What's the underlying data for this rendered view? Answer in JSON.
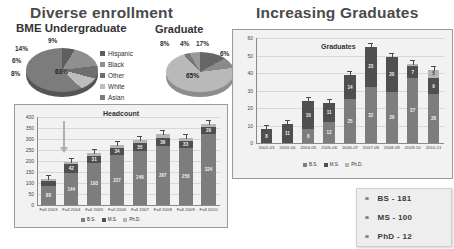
{
  "slide": {
    "titles": {
      "left": "Diverse enrollment",
      "right": "Increasing Graduates",
      "pie_undergrad": "BME Undergraduate",
      "pie_grad": "Graduate"
    }
  },
  "pie_legend": [
    {
      "label": "Hispanic",
      "color": "#5e5e5e"
    },
    {
      "label": "Black",
      "color": "#8f8f8f"
    },
    {
      "label": "Other",
      "color": "#6e6e6e"
    },
    {
      "label": "White",
      "color": "#bdbdbd"
    },
    {
      "label": "Asian",
      "color": "#7c7c7c"
    }
  ],
  "bar_legend": [
    {
      "label": "B.S.",
      "color": "#7d7d7d"
    },
    {
      "label": "M.S.",
      "color": "#4f4f4f"
    },
    {
      "label": "Ph.D.",
      "color": "#b5b5b5"
    }
  ],
  "summary": {
    "items": [
      {
        "label": "BS - 181"
      },
      {
        "label": "MS - 100"
      },
      {
        "label": "PhD - 12"
      }
    ]
  },
  "chart_data": [
    {
      "type": "pie",
      "title": "BME Undergraduate",
      "categories": [
        "Hispanic",
        "Black",
        "Other",
        "White",
        "Asian"
      ],
      "values": [
        9,
        14,
        6,
        8,
        63
      ],
      "labels": [
        "9%",
        "14%",
        "6%",
        "8%",
        "63%"
      ],
      "legend_position": "right"
    },
    {
      "type": "pie",
      "title": "Graduate",
      "categories": [
        "Hispanic",
        "Black",
        "Other",
        "White",
        "Asian"
      ],
      "values": [
        17,
        6,
        65,
        4,
        8
      ],
      "labels": [
        "17%",
        "6%",
        "65%",
        "4%",
        "8%"
      ],
      "legend_position": "shared-left"
    },
    {
      "type": "bar",
      "subtype": "stacked",
      "title": "Headcount",
      "xlabel": "",
      "ylabel": "",
      "ylim": [
        0,
        400
      ],
      "yticks": [
        0,
        50,
        100,
        150,
        200,
        250,
        300,
        350,
        400
      ],
      "grid": true,
      "categories": [
        "Fall 2003",
        "Fall 2004",
        "Fall 2005",
        "Fall 2006",
        "Fall 2007",
        "Fall 2008",
        "Fall 2009",
        "Fall 2010"
      ],
      "series": [
        {
          "name": "B.S.",
          "values": [
            88,
            144,
            193,
            227,
            246,
            267,
            258,
            324
          ]
        },
        {
          "name": "M.S.",
          "values": [
            22,
            42,
            31,
            34,
            35,
            36,
            33,
            29
          ]
        },
        {
          "name": "Ph.D.",
          "values": [
            6,
            8,
            11,
            11,
            15,
            20,
            13,
            14
          ]
        }
      ],
      "totals": [
        116,
        194,
        235,
        272,
        296,
        323,
        304,
        367
      ]
    },
    {
      "type": "bar",
      "subtype": "stacked",
      "title": "Graduates",
      "xlabel": "",
      "ylabel": "",
      "ylim": [
        0,
        60
      ],
      "yticks": [
        0,
        10,
        20,
        30,
        40,
        50,
        60
      ],
      "grid": true,
      "categories": [
        "2002-03",
        "2003-04",
        "2004-05",
        "2005-06",
        "2006-07",
        "2007-08",
        "2008-09",
        "2009-10",
        "2010-11"
      ],
      "series": [
        {
          "name": "B.S.",
          "values": [
            0,
            0,
            8,
            12,
            25,
            32,
            29,
            37,
            28
          ]
        },
        {
          "name": "M.S.",
          "values": [
            8,
            11,
            16,
            11,
            14,
            23,
            20,
            7,
            9
          ]
        },
        {
          "name": "Ph.D.",
          "values": [
            0,
            0,
            0,
            0,
            0,
            0,
            0,
            1,
            5
          ]
        }
      ],
      "totals": [
        8,
        11,
        24,
        23,
        39,
        42,
        49,
        45,
        47
      ]
    }
  ]
}
